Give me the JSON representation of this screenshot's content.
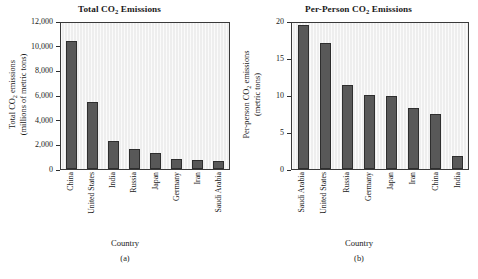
{
  "figure": {
    "panels": [
      {
        "caption": "(a)",
        "title_prefix": "Total CO",
        "title_sub": "2",
        "title_suffix": " Emissions",
        "xaxis_title": "Country",
        "yaxis_line1_prefix": "Total CO",
        "yaxis_line1_sub": "2",
        "yaxis_line1_suffix": " emissions",
        "yaxis_line2": "(millions of metric tons)"
      },
      {
        "caption": "(b)",
        "title_prefix": "Per-Person CO",
        "title_sub": "2",
        "title_suffix": " Emissions",
        "xaxis_title": "Country",
        "yaxis_line1_prefix": "Per-person CO",
        "yaxis_line1_sub": "2",
        "yaxis_line1_suffix": " emissions",
        "yaxis_line2": "(metric tons)"
      }
    ]
  },
  "chart_data": [
    {
      "type": "bar",
      "title": "Total CO2 Emissions",
      "xlabel": "Country",
      "ylabel": "Total CO2 emissions (millions of metric tons)",
      "categories": [
        "China",
        "United States",
        "India",
        "Russia",
        "Japan",
        "Germany",
        "Iran",
        "Saudi Arabia"
      ],
      "values": [
        10400,
        5450,
        2300,
        1650,
        1300,
        850,
        700,
        620
      ],
      "ylim": [
        0,
        12000
      ],
      "yticks": [
        0,
        2000,
        4000,
        6000,
        8000,
        10000,
        12000
      ],
      "ytick_labels": [
        "0",
        "2,000",
        "4,000",
        "6,000",
        "8,000",
        "10,000",
        "12,000"
      ],
      "grid": false,
      "legend": "none",
      "bar_color": "#585858",
      "plot_background": "#eeeeee",
      "caption": "(a)"
    },
    {
      "type": "bar",
      "title": "Per-Person CO2 Emissions",
      "xlabel": "Country",
      "ylabel": "Per-person CO2 emissions (metric tons)",
      "categories": [
        "Saudi Arabia",
        "United States",
        "Russia",
        "Germany",
        "Japan",
        "Iran",
        "China",
        "India"
      ],
      "values": [
        19.5,
        17.0,
        11.3,
        10.0,
        9.8,
        8.2,
        7.5,
        1.8
      ],
      "ylim": [
        0,
        20
      ],
      "yticks": [
        0,
        5,
        10,
        15,
        20
      ],
      "ytick_labels": [
        "0",
        "5",
        "10",
        "15",
        "20"
      ],
      "grid": false,
      "legend": "none",
      "bar_color": "#585858",
      "plot_background": "#eeeeee",
      "caption": "(b)"
    }
  ]
}
